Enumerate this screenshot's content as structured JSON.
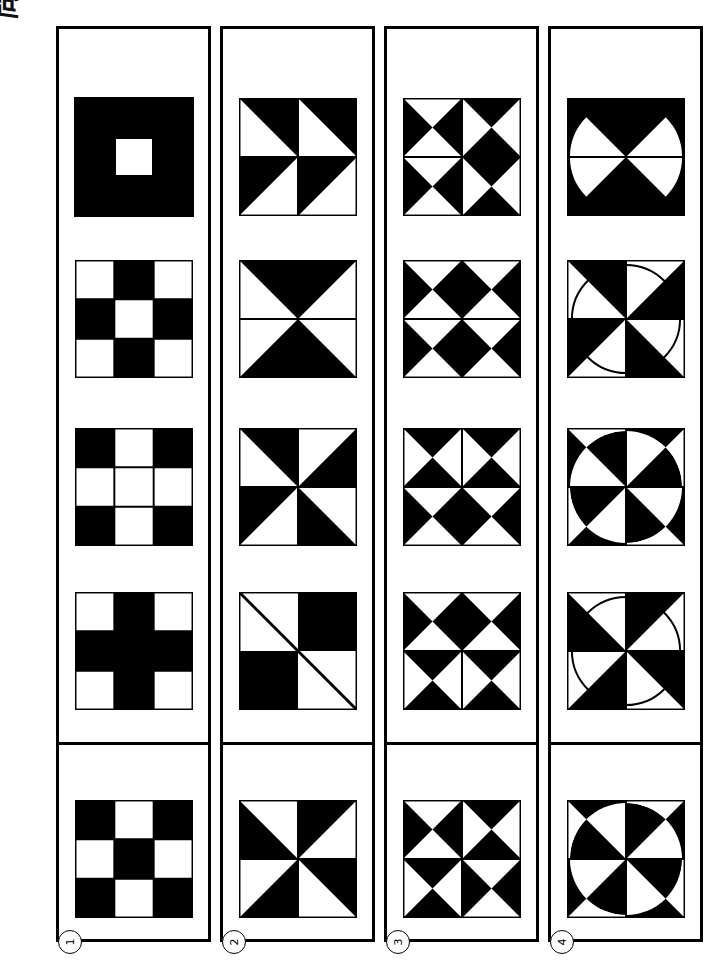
{
  "header": {
    "title": "問題 8",
    "title_plain": "Problem 8"
  },
  "puzzle": {
    "type": "visual-sequence-multiple-choice",
    "rows": 4,
    "answer_row_label": "answer-row",
    "colors": {
      "ink": "#000000",
      "paper": "#ffffff"
    }
  },
  "options": [
    {
      "number": "1",
      "label": "①"
    },
    {
      "number": "2",
      "label": "②"
    },
    {
      "number": "3",
      "label": "③"
    },
    {
      "number": "4",
      "label": "④"
    }
  ],
  "columns": [
    {
      "id": "column-1",
      "option": "1",
      "cells": [
        {
          "id": "c1r1",
          "name": "black-square-with-white-center-hole",
          "pattern": "donut"
        },
        {
          "id": "c1r2",
          "name": "checkerboard-white-corners",
          "pattern": "checker-white-corners"
        },
        {
          "id": "c1r3",
          "name": "white-plus-black-corners",
          "pattern": "plus-white"
        },
        {
          "id": "c1r4",
          "name": "black-plus-white-corners",
          "pattern": "plus-black"
        }
      ],
      "answer": {
        "id": "c1rA",
        "name": "checkerboard-black-corners",
        "pattern": "checker-black-corners"
      }
    },
    {
      "id": "column-2",
      "option": "2",
      "cells": [
        {
          "id": "c2r1",
          "name": "four-diagonal-triangles-upper-lower",
          "pattern": "quad-diag-a"
        },
        {
          "id": "c2r2",
          "name": "vertical-bowtie-hourglass",
          "pattern": "bowtie-vertical"
        },
        {
          "id": "c2r3",
          "name": "pinwheel-counterclockwise",
          "pattern": "pinwheel-a"
        },
        {
          "id": "c2r4",
          "name": "two-by-two-checker-with-diagonal-line",
          "pattern": "checker2-diag"
        }
      ],
      "answer": {
        "id": "c2rA",
        "name": "pinwheel-clockwise",
        "pattern": "pinwheel-b"
      }
    },
    {
      "id": "column-3",
      "option": "3",
      "cells": [
        {
          "id": "c3r1",
          "name": "four-bowties-mixed-a",
          "pattern": "bowties-vhvh"
        },
        {
          "id": "c3r2",
          "name": "four-bowties-horizontal",
          "pattern": "bowties-hhhh"
        },
        {
          "id": "c3r3",
          "name": "four-bowties-top-horizontal-bottom-vertical",
          "pattern": "bowties-hhvv"
        },
        {
          "id": "c3r4",
          "name": "four-bowties-top-vertical-bottom-horizontal",
          "pattern": "bowties-vvhh"
        }
      ],
      "answer": {
        "id": "c3rA",
        "name": "four-bowties-mixed-b",
        "pattern": "bowties-hvvh"
      }
    },
    {
      "id": "column-4",
      "option": "4",
      "cells": [
        {
          "id": "c4r1",
          "name": "circle-bowtie-black-corners",
          "pattern": "circle-bowtie"
        },
        {
          "id": "c4r2",
          "name": "pinwheel-with-circle-outline",
          "pattern": "circle-pinwheel-outline"
        },
        {
          "id": "c4r3",
          "name": "pinwheel-inverted-inside-circle-a",
          "pattern": "circle-pinwheel-invert-a"
        },
        {
          "id": "c4r4",
          "name": "pinwheel-with-circle-outline-rotated",
          "pattern": "circle-pinwheel-outline-b"
        }
      ],
      "answer": {
        "id": "c4rA",
        "name": "pinwheel-inverted-inside-circle-b",
        "pattern": "circle-pinwheel-invert-b"
      }
    }
  ]
}
